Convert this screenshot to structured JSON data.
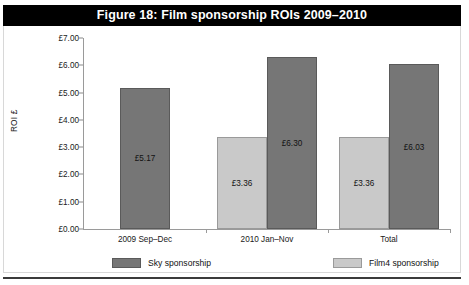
{
  "figure": {
    "title": "Figure 18: Film sponsorship ROIs 2009–2010",
    "title_bar_color": "#000000",
    "title_text_color": "#ffffff"
  },
  "colors": {
    "sky": "#767676",
    "film4": "#c9c9c9",
    "axis": "#9a9a9a",
    "text": "#111111"
  },
  "legend": {
    "position": "bottom",
    "items": [
      {
        "label": "Sky sponsorship",
        "color": "#767676",
        "swatch": "sky"
      },
      {
        "label": "Film4 sponsorship",
        "color": "#c9c9c9",
        "swatch": "film4"
      }
    ]
  },
  "chart_data": {
    "type": "bar",
    "title": "Figure 18: Film sponsorship ROIs 2009–2010",
    "xlabel": "",
    "ylabel": "ROI £",
    "categories": [
      "2009 Sep–Dec",
      "2010 Jan–Nov",
      "Total"
    ],
    "series": [
      {
        "name": "Sky sponsorship",
        "color": "#767676",
        "values": [
          5.17,
          6.3,
          6.03
        ],
        "labels": [
          "£5.17",
          "£6.30",
          "£6.03"
        ]
      },
      {
        "name": "Film4 sponsorship",
        "color": "#c9c9c9",
        "values": [
          null,
          3.36,
          3.36
        ],
        "labels": [
          null,
          "£3.36",
          "£3.36"
        ]
      }
    ],
    "ylim": [
      0,
      7
    ],
    "ytick_values": [
      0,
      1,
      2,
      3,
      4,
      5,
      6,
      7
    ],
    "ytick_labels": [
      "£0.00",
      "£1.00",
      "£2.00",
      "£3.00",
      "£4.00",
      "£5.00",
      "£6.00",
      "£7.00"
    ],
    "grid": false,
    "legend_position": "bottom",
    "bar_order_in_group": [
      "Film4 sponsorship",
      "Sky sponsorship"
    ]
  }
}
